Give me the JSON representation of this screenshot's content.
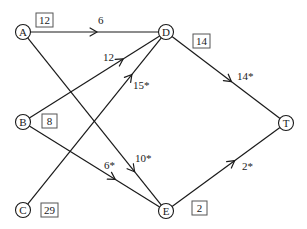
{
  "diagram": {
    "type": "network-flow-graph",
    "colors": {
      "stroke": "#1a1a1a",
      "box_border": "#555555",
      "background": "#ffffff"
    },
    "nodes": [
      {
        "id": "A",
        "label": "A",
        "x": 23,
        "y": 32,
        "box": {
          "value": "12",
          "x": 36,
          "y": 13
        }
      },
      {
        "id": "B",
        "label": "B",
        "x": 23,
        "y": 122,
        "box": {
          "value": "8",
          "x": 42,
          "y": 114
        }
      },
      {
        "id": "C",
        "label": "C",
        "x": 23,
        "y": 210,
        "box": {
          "value": "29",
          "x": 41,
          "y": 203
        }
      },
      {
        "id": "D",
        "label": "D",
        "x": 166,
        "y": 32,
        "box": {
          "value": "14",
          "x": 193,
          "y": 34
        }
      },
      {
        "id": "E",
        "label": "E",
        "x": 166,
        "y": 211,
        "box": {
          "value": "2",
          "x": 192,
          "y": 201
        }
      },
      {
        "id": "T",
        "label": "T",
        "x": 286,
        "y": 123,
        "box": null
      }
    ],
    "edges": [
      {
        "from": "A",
        "to": "D",
        "label": "6",
        "label_x": 98,
        "label_y": 24,
        "arrow_t": 0.52
      },
      {
        "from": "B",
        "to": "D",
        "label": "12",
        "label_x": 103,
        "label_y": 61,
        "arrow_t": 0.72
      },
      {
        "from": "C",
        "to": "D",
        "label": "15*",
        "label_x": 133,
        "label_y": 89,
        "arrow_t": 0.78
      },
      {
        "from": "A",
        "to": "E",
        "label": "10*",
        "label_x": 135,
        "label_y": 162,
        "arrow_t": 0.8
      },
      {
        "from": "B",
        "to": "E",
        "label": "6*",
        "label_x": 104,
        "label_y": 169,
        "arrow_t": 0.66
      },
      {
        "from": "D",
        "to": "T",
        "label": "14*",
        "label_x": 237,
        "label_y": 80,
        "arrow_t": 0.55
      },
      {
        "from": "E",
        "to": "T",
        "label": "2*",
        "label_x": 242,
        "label_y": 170,
        "arrow_t": 0.58
      }
    ]
  }
}
